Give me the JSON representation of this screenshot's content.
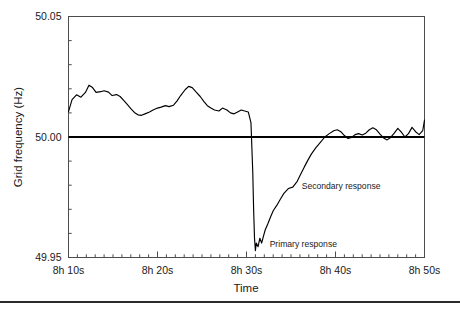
{
  "chart_data": {
    "type": "line",
    "title": "",
    "xlabel": "Time",
    "ylabel": "Grid frequency (Hz)",
    "xtick_labels": [
      "8h 10s",
      "8h 20s",
      "8h 30s",
      "8h 40s",
      "8h 50s"
    ],
    "xtick_values": [
      10,
      20,
      30,
      40,
      50
    ],
    "xlim": [
      10,
      50
    ],
    "ytick_labels": [
      "50.05",
      "50.00",
      "49.95"
    ],
    "ytick_values": [
      50.05,
      50.0,
      49.95
    ],
    "ylim": [
      49.95,
      50.05
    ],
    "y_minor_ticks": [
      50.04,
      50.03,
      50.02,
      50.01,
      49.99,
      49.98,
      49.97,
      49.96
    ],
    "x_minor_tick_step": 1,
    "grid": false,
    "legend": "none",
    "reference_line": {
      "value": 50.0,
      "label": "50.00 Hz nominal"
    },
    "annotations": [
      {
        "text": "Secondary response",
        "x": 36.2,
        "y": 49.9785
      },
      {
        "text": "Primary response",
        "x": 32.6,
        "y": 49.9545
      }
    ],
    "series": [
      {
        "name": "Grid frequency",
        "x": [
          10.0,
          10.4,
          10.9,
          11.4,
          11.9,
          12.3,
          12.7,
          13.1,
          13.6,
          14.0,
          14.5,
          14.9,
          15.4,
          15.8,
          16.2,
          16.6,
          17.0,
          17.4,
          17.8,
          18.2,
          18.6,
          19.1,
          19.5,
          20.0,
          20.4,
          20.9,
          21.3,
          21.8,
          22.2,
          22.6,
          23.1,
          23.5,
          23.9,
          24.3,
          24.8,
          25.2,
          25.6,
          26.0,
          26.4,
          26.9,
          27.3,
          27.8,
          28.2,
          28.6,
          29.0,
          29.4,
          29.8,
          30.2,
          30.5,
          30.7,
          30.8,
          30.9,
          31.0,
          31.1,
          31.3,
          31.5,
          31.7,
          31.9,
          32.1,
          32.4,
          32.7,
          33.0,
          33.4,
          33.8,
          34.2,
          34.7,
          35.2,
          35.7,
          36.1,
          36.5,
          36.9,
          37.3,
          37.8,
          38.3,
          38.8,
          39.3,
          39.8,
          40.2,
          40.6,
          41.0,
          41.4,
          41.8,
          42.2,
          42.6,
          43.0,
          43.4,
          43.8,
          44.2,
          44.6,
          45.0,
          45.4,
          45.8,
          46.2,
          46.6,
          47.0,
          47.4,
          47.8,
          48.2,
          48.6,
          49.0,
          49.4,
          49.8,
          50.0
        ],
        "y": [
          50.0105,
          50.0155,
          50.0175,
          50.0165,
          50.0185,
          50.0215,
          50.0205,
          50.0185,
          50.0188,
          50.0192,
          50.0186,
          50.0172,
          50.0176,
          50.0168,
          50.0152,
          50.0135,
          50.0118,
          50.0102,
          50.0092,
          50.009,
          50.0096,
          50.0104,
          50.0112,
          50.012,
          50.0124,
          50.013,
          50.0126,
          50.0132,
          50.015,
          50.0172,
          50.0196,
          50.021,
          50.0205,
          50.0188,
          50.0168,
          50.0148,
          50.013,
          50.012,
          50.0112,
          50.0108,
          50.012,
          50.0112,
          50.01,
          50.0096,
          50.0104,
          50.0112,
          50.0108,
          50.0104,
          50.006,
          49.986,
          49.97,
          49.958,
          49.9528,
          49.956,
          49.9545,
          49.958,
          49.956,
          49.9588,
          49.9614,
          49.964,
          49.9668,
          49.9694,
          49.9716,
          49.9742,
          49.9766,
          49.9786,
          49.9792,
          49.9816,
          49.9846,
          49.9876,
          49.9904,
          49.993,
          49.9956,
          49.9978,
          50.0,
          50.0014,
          50.0026,
          50.003,
          50.0022,
          50.0006,
          49.9994,
          49.9998,
          50.001,
          50.0014,
          50.0008,
          50.0016,
          50.003,
          50.0038,
          50.003,
          50.0012,
          49.9996,
          49.9988,
          49.9998,
          50.0016,
          50.0036,
          50.002,
          50.0,
          50.0014,
          50.004,
          50.0022,
          50.001,
          50.0026,
          50.007
        ]
      }
    ]
  },
  "axis": {
    "ylabel": "Grid frequency (Hz)",
    "xlabel": "Time"
  }
}
